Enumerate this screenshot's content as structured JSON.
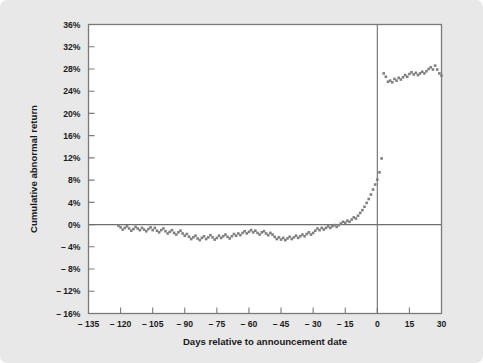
{
  "figure": {
    "background_color": "#e8e8e8",
    "plot_background_color": "#ffffff",
    "frame_color": "#7a7a7a",
    "marker_color": "#808080",
    "zero_line_color": "#6e6e6e",
    "event_line_color": "#6e6e6e",
    "text_color": "#1a1a1a"
  },
  "chart_data": {
    "type": "scatter",
    "title": "",
    "subtitle": "",
    "xlabel": "Days relative to announcement date",
    "ylabel": "Cumulative abnormal return",
    "xlim": [
      -135,
      30
    ],
    "ylim": [
      -16,
      36
    ],
    "xticks": [
      -135,
      -120,
      -105,
      -90,
      -75,
      -60,
      -45,
      -30,
      -15,
      0,
      15,
      30
    ],
    "xticklabels": [
      "-135",
      "-120",
      "-105",
      "-90",
      "-75",
      "-60",
      "-45",
      "-30",
      "-15",
      "0",
      "15",
      "30"
    ],
    "yticks": [
      -16,
      -12,
      -8,
      -4,
      0,
      4,
      8,
      12,
      16,
      20,
      24,
      28,
      32,
      36
    ],
    "yticklabels": [
      "-16%",
      "-12%",
      "-8%",
      "-4%",
      "0%",
      "4%",
      "8%",
      "12%",
      "16%",
      "20%",
      "24%",
      "28%",
      "32%",
      "36%"
    ],
    "grid": false,
    "legend": null,
    "annotations": [
      {
        "type": "hline",
        "y": 0,
        "label": "zero abnormal return"
      },
      {
        "type": "vline",
        "x": 0,
        "label": "announcement date"
      }
    ],
    "marker_style": "square",
    "marker_size": 2.6,
    "x": [
      -121,
      -120,
      -119,
      -118,
      -117,
      -116,
      -115,
      -114,
      -113,
      -112,
      -111,
      -110,
      -109,
      -108,
      -107,
      -106,
      -105,
      -104,
      -103,
      -102,
      -101,
      -100,
      -99,
      -98,
      -97,
      -96,
      -95,
      -94,
      -93,
      -92,
      -91,
      -90,
      -89,
      -88,
      -87,
      -86,
      -85,
      -84,
      -83,
      -82,
      -81,
      -80,
      -79,
      -78,
      -77,
      -76,
      -75,
      -74,
      -73,
      -72,
      -71,
      -70,
      -69,
      -68,
      -67,
      -66,
      -65,
      -64,
      -63,
      -62,
      -61,
      -60,
      -59,
      -58,
      -57,
      -56,
      -55,
      -54,
      -53,
      -52,
      -51,
      -50,
      -49,
      -48,
      -47,
      -46,
      -45,
      -44,
      -43,
      -42,
      -41,
      -40,
      -39,
      -38,
      -37,
      -36,
      -35,
      -34,
      -33,
      -32,
      -31,
      -30,
      -29,
      -28,
      -27,
      -26,
      -25,
      -24,
      -23,
      -22,
      -21,
      -20,
      -19,
      -18,
      -17,
      -16,
      -15,
      -14,
      -13,
      -12,
      -11,
      -10,
      -9,
      -8,
      -7,
      -6,
      -5,
      -4,
      -3,
      -2,
      -1,
      0,
      1,
      2,
      3,
      4,
      5,
      6,
      7,
      8,
      9,
      10,
      11,
      12,
      13,
      14,
      15,
      16,
      17,
      18,
      19,
      20,
      21,
      22,
      23,
      24,
      25,
      26,
      27,
      28,
      29,
      30
    ],
    "y": [
      -0.2,
      -0.5,
      -0.9,
      -0.6,
      -0.3,
      -0.7,
      -1.1,
      -0.8,
      -0.4,
      -0.7,
      -1.0,
      -0.6,
      -0.9,
      -1.2,
      -0.8,
      -0.5,
      -1.0,
      -0.6,
      -1.1,
      -1.4,
      -1.0,
      -0.7,
      -1.2,
      -1.6,
      -1.3,
      -1.0,
      -1.5,
      -1.8,
      -1.4,
      -1.1,
      -1.6,
      -2.0,
      -1.7,
      -2.2,
      -2.6,
      -2.3,
      -2.0,
      -2.5,
      -2.8,
      -2.4,
      -2.1,
      -2.6,
      -2.3,
      -1.9,
      -2.3,
      -2.7,
      -2.4,
      -2.0,
      -2.4,
      -2.1,
      -1.8,
      -2.2,
      -2.5,
      -2.1,
      -1.7,
      -2.0,
      -1.6,
      -1.9,
      -1.5,
      -1.2,
      -1.6,
      -1.3,
      -1.0,
      -1.4,
      -1.1,
      -1.5,
      -1.8,
      -1.4,
      -1.2,
      -1.6,
      -1.9,
      -1.5,
      -1.8,
      -2.2,
      -2.6,
      -2.3,
      -2.7,
      -2.4,
      -2.8,
      -2.5,
      -2.2,
      -2.6,
      -2.3,
      -2.0,
      -2.4,
      -2.1,
      -1.8,
      -2.1,
      -1.7,
      -1.4,
      -1.8,
      -1.5,
      -1.1,
      -0.7,
      -1.0,
      -0.6,
      -0.9,
      -0.6,
      -0.3,
      -0.6,
      -0.3,
      -0.1,
      -0.4,
      -0.1,
      0.2,
      0.5,
      0.3,
      0.7,
      0.5,
      0.9,
      1.3,
      1.1,
      1.6,
      2.1,
      2.6,
      3.2,
      3.9,
      4.6,
      5.4,
      6.3,
      7.2,
      8.1,
      9.4,
      11.9,
      27.2,
      26.6,
      25.7,
      25.9,
      25.6,
      26.2,
      25.9,
      26.4,
      26.1,
      26.5,
      26.9,
      26.6,
      27.1,
      27.4,
      27.0,
      27.3,
      26.9,
      27.2,
      27.5,
      27.2,
      27.6,
      28.0,
      28.3,
      27.9,
      28.6,
      27.9,
      27.2,
      26.8,
      27.1,
      26.9
    ]
  }
}
